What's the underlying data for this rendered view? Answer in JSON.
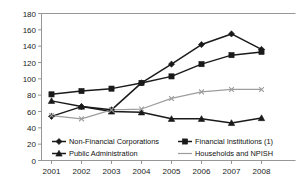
{
  "chart_data": {
    "type": "line",
    "title": "",
    "xlabel": "",
    "ylabel": "",
    "categories": [
      "2001",
      "2002",
      "2003",
      "2004",
      "2005",
      "2006",
      "2007",
      "2008"
    ],
    "ylim": [
      0,
      180
    ],
    "ytick_labels": [
      "0",
      "20",
      "40",
      "60",
      "80",
      "100",
      "120",
      "140",
      "160",
      "180"
    ],
    "ytick_values": [
      0,
      20,
      40,
      60,
      80,
      100,
      120,
      140,
      160,
      180
    ],
    "grid": false,
    "legend_position": "bottom",
    "series": [
      {
        "name": "Non-Financial Corporations",
        "color": "#1a1a1a",
        "marker": "diamond",
        "values": [
          54,
          66,
          62,
          95,
          118,
          142,
          155,
          136
        ]
      },
      {
        "name": "Financial Institutions (1)",
        "color": "#1a1a1a",
        "marker": "square",
        "values": [
          81,
          85,
          88,
          95,
          103,
          118,
          129,
          133
        ]
      },
      {
        "name": "Public Administration",
        "color": "#1a1a1a",
        "marker": "triangle",
        "values": [
          73,
          66,
          60,
          59,
          51,
          51,
          46,
          52
        ]
      },
      {
        "name": "Households and NPISH",
        "color": "#9d9d9d",
        "marker": "cross",
        "values": [
          55,
          51,
          62,
          63,
          76,
          84,
          87,
          87
        ]
      }
    ]
  },
  "legend": {
    "items": [
      {
        "label": "Non-Financial Corporations",
        "marker": "diamond",
        "color": "#1a1a1a"
      },
      {
        "label": "Financial Institutions (1)",
        "marker": "square",
        "color": "#1a1a1a"
      },
      {
        "label": "Public Administration",
        "marker": "triangle",
        "color": "#1a1a1a"
      },
      {
        "label": "Households and NPISH",
        "marker": "line",
        "color": "#9d9d9d"
      }
    ]
  }
}
